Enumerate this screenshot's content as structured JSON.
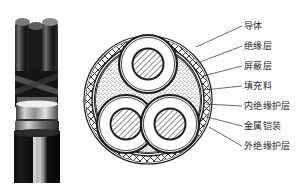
{
  "figure": {
    "title": "",
    "photo": {
      "name": "armoured-three-core-cable-photograph",
      "description": "三芯铠装电缆实物照片"
    },
    "cross_section": {
      "name": "cable-cross-section-diagram",
      "core_count": 3,
      "center_x": 148,
      "center_y": 100,
      "outer_radius": 64
    },
    "labels": [
      {
        "id": "conductor",
        "text": "导体",
        "x": 244,
        "y": 22,
        "leader_from_x": 242,
        "leader_from_y": 26,
        "leader_to_x": 196,
        "leader_to_y": 47
      },
      {
        "id": "insulation-layer",
        "text": "绝缘层",
        "x": 244,
        "y": 42,
        "leader_from_x": 242,
        "leader_from_y": 46,
        "leader_to_x": 200,
        "leader_to_y": 62
      },
      {
        "id": "shielding-layer",
        "text": "屏蔽层",
        "x": 244,
        "y": 62,
        "leader_from_x": 242,
        "leader_from_y": 66,
        "leader_to_x": 203,
        "leader_to_y": 76
      },
      {
        "id": "filler",
        "text": "填充料",
        "x": 244,
        "y": 82,
        "leader_from_x": 242,
        "leader_from_y": 86,
        "leader_to_x": 204,
        "leader_to_y": 90
      },
      {
        "id": "inner-insulation-sheath",
        "text": "内绝缘护层",
        "x": 244,
        "y": 102,
        "leader_from_x": 242,
        "leader_from_y": 106,
        "leader_to_x": 206,
        "leader_to_y": 104
      },
      {
        "id": "metal-armour",
        "text": "金属铠装",
        "x": 244,
        "y": 122,
        "leader_from_x": 242,
        "leader_from_y": 126,
        "leader_to_x": 207,
        "leader_to_y": 117
      },
      {
        "id": "outer-insulation-sheath",
        "text": "外绝缘护层",
        "x": 244,
        "y": 142,
        "leader_from_x": 242,
        "leader_from_y": 146,
        "leader_to_x": 209,
        "leader_to_y": 127
      }
    ],
    "colors": {
      "ink": "#1c1c1c",
      "background": "#ffffff",
      "filler_stipple": "#9a9a9a",
      "photo_dark": "#101010",
      "photo_mid": "#6b6b6b",
      "photo_light": "#cfcfcf"
    }
  }
}
